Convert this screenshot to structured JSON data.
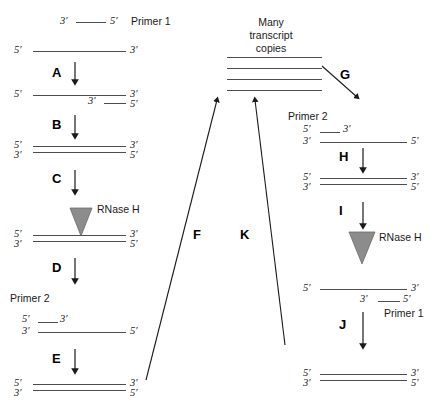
{
  "figure": {
    "stroke_color": "#4d4d4d",
    "enzyme_fill": "#8c8c8c",
    "text_color": "#1a1a1a"
  },
  "labels": {
    "primer1": "Primer 1",
    "primer2": "Primer 2",
    "rnase_h": "RNase H",
    "many": "Many",
    "transcript": "transcript",
    "copies": "copies",
    "five_prime": "5′",
    "three_prime": "3′"
  },
  "steps": {
    "a": "A",
    "b": "B",
    "c": "C",
    "d": "D",
    "e": "E",
    "f": "F",
    "g": "G",
    "h": "H",
    "i": "I",
    "j": "J",
    "k": "K"
  },
  "left_column": {
    "primer1_legend": {
      "left_end": "3′",
      "right_end": "5′",
      "name": "Primer 1"
    },
    "stage1": {
      "left_end": "5′",
      "right_end": "3′"
    },
    "stage2": {
      "top_left_end": "5′",
      "top_right_end": "3′",
      "primer_left_end": "3′",
      "primer_right_end": "5′"
    },
    "stage3": {
      "top_left_end": "5′",
      "top_right_end": "3′",
      "bottom_left_end": "3′",
      "bottom_right_end": "5′"
    },
    "stage4": {
      "enzyme": "RNase H",
      "top_left_end": "5′",
      "top_right_end": "3′",
      "bottom_left_end": "3′",
      "bottom_right_end": "5′"
    },
    "stage5": {
      "primer_name": "Primer 2",
      "primer_left_end": "5′",
      "primer_right_end": "3′",
      "template_left_end": "3′",
      "template_right_end": "5′"
    },
    "stage6": {
      "top_left_end": "5′",
      "top_right_end": "3′",
      "bottom_left_end": "3′",
      "bottom_right_end": "5′"
    }
  },
  "center": {
    "transcripts_caption": [
      "Many",
      "transcript",
      "copies"
    ],
    "transcript_line_count": 4
  },
  "right_column": {
    "stage1": {
      "primer_name": "Primer 2",
      "primer_left_end": "5′",
      "primer_right_end": "3′",
      "template_left_end": "3′",
      "template_right_end": "5′"
    },
    "stage2": {
      "top_left_end": "5′",
      "top_right_end": "3′",
      "bottom_left_end": "3′",
      "bottom_right_end": "5′"
    },
    "stage3": {
      "enzyme": "RNase H"
    },
    "stage4": {
      "top_left_end": "5′",
      "top_right_end": "3′",
      "primer_left_end": "3′",
      "primer_right_end": "5′",
      "primer_name": "Primer 1"
    },
    "stage5": {
      "top_left_end": "5′",
      "top_right_end": "3′",
      "bottom_left_end": "3′",
      "bottom_right_end": "5′"
    }
  }
}
